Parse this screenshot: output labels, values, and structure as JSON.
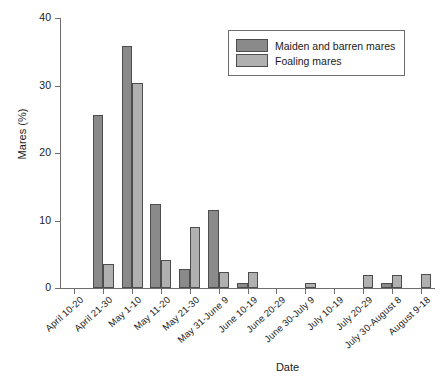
{
  "chart_data": {
    "type": "bar",
    "title": "",
    "xlabel": "Date",
    "ylabel": "Mares (%)",
    "ylim": [
      0,
      40
    ],
    "yticks": [
      0,
      10,
      20,
      30,
      40
    ],
    "grid": false,
    "legend_position": "top-right",
    "orientation": "vertical",
    "grouping": "grouped",
    "categories": [
      "April 10-20",
      "April 21-30",
      "May 1-10",
      "May 11-20",
      "May 21-30",
      "May 31-June 9",
      "June 10-19",
      "June 20-29",
      "June 30-July 9",
      "July 10-19",
      "July 20-29",
      "July 30-August 8",
      "August 9-18"
    ],
    "series": [
      {
        "name": "Maiden and barren mares",
        "color": "#8a8a8a",
        "values": [
          0,
          25.6,
          35.8,
          12.4,
          2.8,
          11.6,
          0.8,
          0,
          0,
          0,
          0,
          0.8,
          0
        ]
      },
      {
        "name": "Foaling mares",
        "color": "#b0b0b0",
        "values": [
          0,
          3.6,
          30.4,
          4.1,
          9.1,
          2.4,
          2.3,
          0,
          0.7,
          0,
          1.9,
          2.0,
          2.1
        ]
      }
    ]
  },
  "legend": {
    "entries": [
      {
        "label": "Maiden and barren mares"
      },
      {
        "label": "Foaling mares"
      }
    ]
  },
  "axes": {
    "y_title": "Mares (%)",
    "x_title": "Date"
  }
}
